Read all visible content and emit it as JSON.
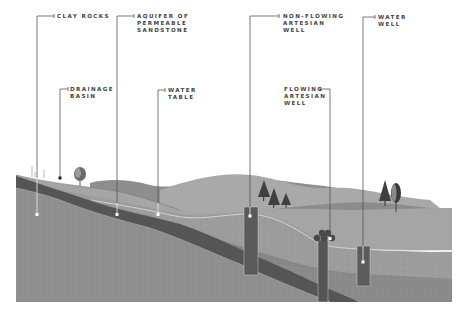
{
  "diagram": {
    "type": "cross-section",
    "colors": {
      "background": "#ffffff",
      "clay_rock": "#8f8f8f",
      "aquifer": "#5a5a5a",
      "upper_layer": "#9a9a9a",
      "soil_light": "#b5b5b5",
      "hill_back": "#8a8a8a",
      "hill_mid": "#a8a8a8",
      "well_casing": "#5e5e5e",
      "leader_line": "#555555",
      "water_table_line": "#d8d8d8"
    },
    "labels": [
      {
        "id": "clay-rocks",
        "text": "CLAY ROCKS"
      },
      {
        "id": "aquifer",
        "text": "AQUIFER OF\nPERMEABLE\nSANDSTONE"
      },
      {
        "id": "non-flowing-well",
        "text": "NON-FLOWING\nARTESIAN\nWELL"
      },
      {
        "id": "water-well",
        "text": "WATER\nWELL"
      },
      {
        "id": "drainage-basin",
        "text": "DRAINAGE\nBASIN"
      },
      {
        "id": "water-table",
        "text": "WATER\nTABLE"
      },
      {
        "id": "flowing-well",
        "text": "FLOWING\nARTESIAN\nWELL"
      }
    ]
  }
}
